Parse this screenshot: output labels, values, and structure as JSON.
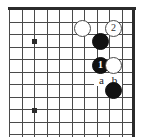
{
  "figure": {
    "type": "go-board-diagram",
    "width_px": 141,
    "height_px": 137,
    "colors": {
      "background": "#ffffff",
      "grid_line": "#4a4a4a",
      "board_edge": "#2b2b2b",
      "black_stone": "#111111",
      "white_stone": "#ffffff",
      "white_stone_border": "#4a4a4a",
      "label_text": "#1a1a1a"
    }
  },
  "grid": {
    "origin_x_px": 9,
    "origin_y_px": 9,
    "spacing_px": 12.5,
    "columns": 11,
    "rows": 11,
    "edge_top": true,
    "edge_right": true,
    "edge_left": false,
    "edge_bottom": false
  },
  "hoshi": [
    {
      "name": "star-point-upper",
      "x_px": 34,
      "y_px": 41
    },
    {
      "name": "star-point-lower",
      "x_px": 34,
      "y_px": 110
    }
  ],
  "stones": [
    {
      "id": "white-plain-upper",
      "color": "white",
      "label": "",
      "x_px": 83,
      "y_px": 29
    },
    {
      "id": "white-move-2",
      "color": "white",
      "label": "2",
      "x_px": 114,
      "y_px": 29
    },
    {
      "id": "black-plain-upper",
      "color": "black",
      "label": "",
      "x_px": 101,
      "y_px": 42
    },
    {
      "id": "black-move-1",
      "color": "black",
      "label": "1",
      "x_px": 101,
      "y_px": 66
    },
    {
      "id": "white-plain-right",
      "color": "white",
      "label": "",
      "x_px": 114,
      "y_px": 66
    },
    {
      "id": "black-plain-lower",
      "color": "black",
      "label": "",
      "x_px": 114,
      "y_px": 91
    }
  ],
  "point_markers": [
    {
      "id": "point-a",
      "label": "a",
      "x_px": 101,
      "y_px": 79
    },
    {
      "id": "point-b",
      "label": "b",
      "x_px": 114,
      "y_px": 79
    }
  ]
}
